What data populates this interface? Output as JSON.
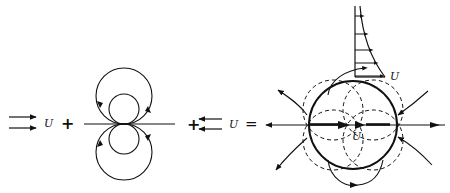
{
  "diagram": {
    "terms": [
      {
        "id": "uniform-stream",
        "label": "U",
        "direction": "right"
      },
      {
        "id": "doublet",
        "label": ""
      },
      {
        "id": "reverse-stream",
        "label": "U",
        "direction": "left"
      },
      {
        "id": "cylinder-flow",
        "labels": [
          "U",
          "U"
        ]
      }
    ],
    "operators": {
      "plus1": "+",
      "plus2": "+",
      "equals": "="
    },
    "labels": {
      "uniform_U": "U",
      "reverse_U": "U",
      "profile_U": "U",
      "center_U": "U"
    },
    "colors": {
      "ink": "#111111",
      "background": "#ffffff"
    }
  }
}
